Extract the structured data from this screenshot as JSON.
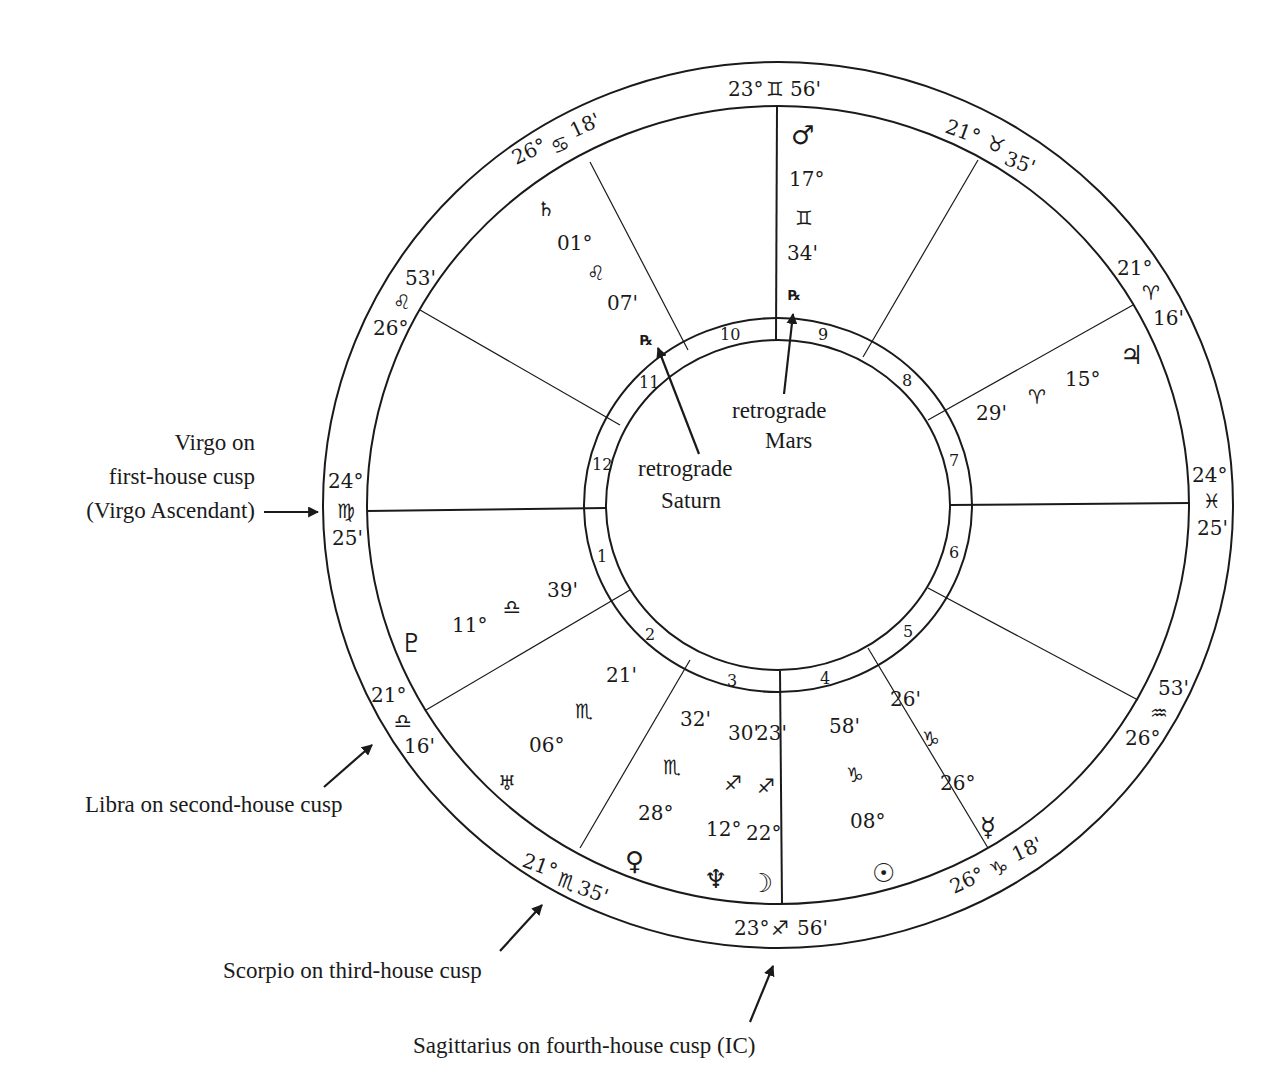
{
  "chart": {
    "cusps": {
      "mc": {
        "deg": "23°",
        "sign": "♊",
        "min": "56'"
      },
      "h11": {
        "deg": "26°",
        "sign": "♋",
        "min": "18'"
      },
      "h12": {
        "deg": "26°",
        "sign": "♌",
        "min": "53'"
      },
      "asc": {
        "deg": "24°",
        "sign": "♍",
        "min": "25'"
      },
      "h2": {
        "deg": "21°",
        "sign": "♎",
        "min": "16'"
      },
      "h3": {
        "deg": "21°",
        "sign": "♏",
        "min": "35'"
      },
      "ic": {
        "deg": "23°",
        "sign": "♐",
        "min": "56'"
      },
      "h5": {
        "deg": "26°",
        "sign": "♑",
        "min": "18'"
      },
      "h6": {
        "deg": "26°",
        "sign": "♒",
        "min": "53'"
      },
      "dsc": {
        "deg": "24°",
        "sign": "♓",
        "min": "25'"
      },
      "h8": {
        "deg": "21°",
        "sign": "♈",
        "min": "16'"
      },
      "h9": {
        "deg": "21°",
        "sign": "♉",
        "min": "35'"
      }
    },
    "house_numbers": [
      "1",
      "2",
      "3",
      "4",
      "5",
      "6",
      "7",
      "8",
      "9",
      "10",
      "11",
      "12"
    ],
    "planets": {
      "mars": {
        "glyph": "♂",
        "deg": "17°",
        "sign": "♊",
        "min": "34'",
        "rx": "℞"
      },
      "saturn": {
        "glyph": "♄",
        "deg": "01°",
        "sign": "♌",
        "min": "07'",
        "rx": "℞"
      },
      "jupiter": {
        "glyph": "♃",
        "deg": "15°",
        "sign": "♈",
        "min": "29'"
      },
      "pluto": {
        "glyph": "♇",
        "deg": "11°",
        "sign": "♎",
        "min": "39'"
      },
      "uranus": {
        "glyph": "♅",
        "deg": "06°",
        "sign": "♏",
        "min": "21'"
      },
      "venus": {
        "glyph": "♀",
        "deg": "28°",
        "sign": "♏",
        "min": "32'"
      },
      "neptune": {
        "glyph": "♆",
        "deg": "12°",
        "sign": "♐",
        "min": "30'"
      },
      "moon": {
        "glyph": "☽",
        "deg": "22°",
        "sign": "♐",
        "min": "23'"
      },
      "sun": {
        "glyph": "☉",
        "deg": "08°",
        "sign": "♑",
        "min": "58'"
      },
      "mercury": {
        "glyph": "☿",
        "deg": "26°",
        "sign": "♑",
        "min": "26'"
      }
    },
    "center_labels": {
      "mars_line1": "retrograde",
      "mars_line2": "Mars",
      "saturn_line1": "retrograde",
      "saturn_line2": "Saturn"
    },
    "annotations": {
      "asc_line1": "Virgo on",
      "asc_line2": "first-house cusp",
      "asc_line3": "(Virgo Ascendant)",
      "h2": "Libra on second-house cusp",
      "h3": "Scorpio on third-house cusp",
      "ic": "Sagittarius on fourth-house cusp (IC)"
    }
  }
}
